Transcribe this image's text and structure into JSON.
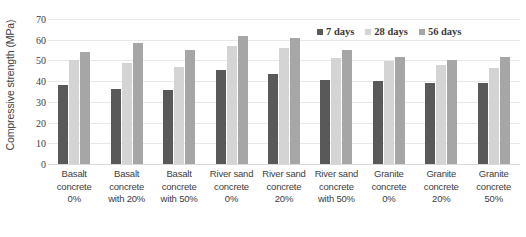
{
  "chart_data": {
    "type": "bar",
    "title": "",
    "xlabel": "",
    "ylabel": "Compressive strength (MPa)",
    "ylim": [
      0,
      70
    ],
    "yticks": [
      70,
      60,
      50,
      40,
      30,
      20,
      10,
      0
    ],
    "grid": true,
    "legend_position": "top-right",
    "categories": [
      "Basalt concrete 0%",
      "Basalt concrete with 20%",
      "Basalt concrete with 50%",
      "River sand concrete 0%",
      "River sand concrete 20%",
      "River sand concrete with 50%",
      "Granite concrete 0%",
      "Granite concrete 20%",
      "Granite concrete 50%"
    ],
    "category_lines": [
      [
        "Basalt",
        "concrete",
        "0%"
      ],
      [
        "Basalt",
        "concrete",
        "with 20%"
      ],
      [
        "Basalt",
        "concrete",
        "with 50%"
      ],
      [
        "River sand",
        "concrete",
        "0%"
      ],
      [
        "River sand",
        "concrete",
        "20%"
      ],
      [
        "River sand",
        "concrete",
        "with 50%"
      ],
      [
        "Granite",
        "concrete",
        "0%"
      ],
      [
        "Granite",
        "concrete",
        "20%"
      ],
      [
        "Granite",
        "concrete",
        "50%"
      ]
    ],
    "series": [
      {
        "name": "7 days",
        "color": "#595959",
        "values": [
          38,
          36,
          35.5,
          45.5,
          43.5,
          40.5,
          40,
          39,
          39
        ]
      },
      {
        "name": "28 days",
        "color": "#d4d4d4",
        "values": [
          50,
          49,
          47,
          57,
          56,
          51,
          49.5,
          48,
          46.5
        ]
      },
      {
        "name": "56 days",
        "color": "#a6a6a6",
        "values": [
          54,
          58.5,
          55,
          62,
          61,
          55,
          51.5,
          50,
          51.5
        ]
      }
    ]
  }
}
